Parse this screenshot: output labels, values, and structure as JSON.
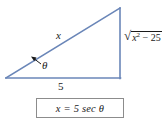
{
  "figure": {
    "name": "right-triangle-trig-substitution",
    "stroke_color": "#6a86b8",
    "text_color": "#1a1a1a",
    "box_border_color": "#8c8c8c",
    "background_color": "#ffffff"
  },
  "triangle": {
    "vertices": {
      "left": [
        6,
        78
      ],
      "bottom_right": [
        120,
        78
      ],
      "apex": [
        120,
        8
      ]
    },
    "sides": {
      "hypotenuse_label": "x",
      "base_label": "5",
      "opposite_label": {
        "radical": "√",
        "radicand_base": "x",
        "radicand_exponent": "2",
        "radicand_rest": " − 25",
        "full": "√(x² − 25)"
      }
    },
    "angle": {
      "label": "θ",
      "leader_arrow": true
    }
  },
  "equation_box": {
    "text": "x = 5 sec θ",
    "parts": {
      "lhs": "x",
      "equals": "=",
      "coefficient": "5",
      "function": "sec",
      "argument": "θ"
    }
  }
}
